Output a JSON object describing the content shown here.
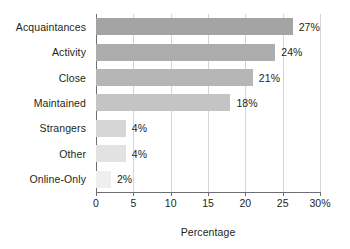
{
  "chart_data": {
    "type": "bar",
    "orientation": "horizontal",
    "title": "",
    "xlabel": "Percentage",
    "ylabel": "",
    "xlim": [
      0,
      30
    ],
    "grid": true,
    "legend": false,
    "categories": [
      "Acquaintances",
      "Activity",
      "Close",
      "Maintained",
      "Strangers",
      "Other",
      "Online-Only"
    ],
    "values": [
      27,
      24,
      21,
      18,
      4,
      4,
      2
    ],
    "data_labels": [
      "27%",
      "24%",
      "21%",
      "18%",
      "4%",
      "4%",
      "2%"
    ],
    "bar_colors": [
      "#a4a4a4",
      "#adadad",
      "#b6b6b6",
      "#c4c4c4",
      "#d6d6d6",
      "#e2e2e2",
      "#efefef"
    ],
    "xticks": [
      0,
      5,
      10,
      15,
      20,
      25,
      30
    ],
    "xtick_labels": [
      "0",
      "5",
      "10",
      "15",
      "20",
      "25",
      "30%"
    ],
    "axis_color": "#6d6e71",
    "grid_color": "#d4d4d4",
    "text_color": "#231f20",
    "background": "#ffffff"
  }
}
